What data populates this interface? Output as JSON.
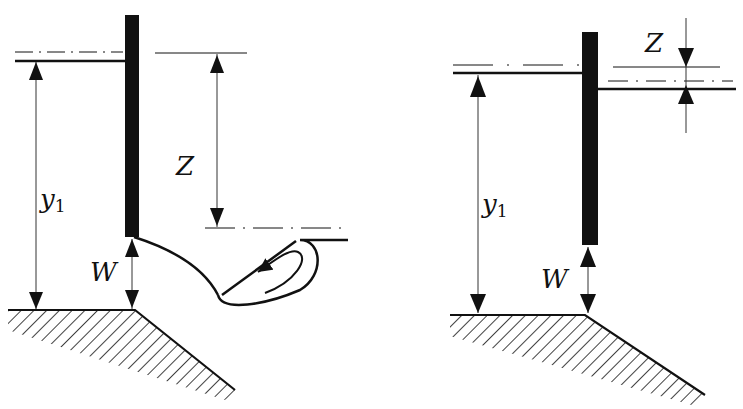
{
  "diagram": {
    "type": "sluice-gate-flow",
    "panels": [
      {
        "name": "free-flow",
        "labels": {
          "upstream_depth": "y",
          "upstream_depth_sub": "1",
          "gate_opening": "W",
          "head_difference": "Z"
        },
        "features": [
          "vertical gate",
          "upstream water surface",
          "hydraulic jump with roller",
          "sloping downstream bed"
        ]
      },
      {
        "name": "submerged-flow",
        "labels": {
          "upstream_depth": "y",
          "upstream_depth_sub": "1",
          "gate_opening": "W",
          "head_difference": "Z"
        },
        "features": [
          "vertical gate",
          "upstream water surface",
          "downstream water surface",
          "sloping downstream bed"
        ]
      }
    ]
  }
}
